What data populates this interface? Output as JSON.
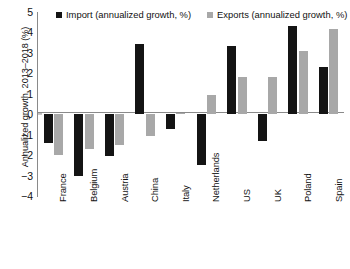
{
  "chart_data": {
    "type": "bar",
    "title": "",
    "xlabel": "",
    "ylabel": "Annualized growth, 2013–2018 (%)",
    "ylim": [
      -4,
      5
    ],
    "yticks": [
      5,
      4,
      3,
      2,
      1,
      0,
      -1,
      -2,
      -3,
      -4
    ],
    "ytick_labels": [
      "5",
      "4",
      "3",
      "2",
      "1",
      "0",
      "−1",
      "−2",
      "−3",
      "−4"
    ],
    "grid": false,
    "legend_position": "top",
    "categories": [
      "France",
      "Belgium",
      "Austria",
      "China",
      "Italy",
      "Netherlands",
      "US",
      "UK",
      "Poland",
      "Spain"
    ],
    "series": [
      {
        "name": "Import (annualized growth, %)",
        "color": "#141414",
        "values": [
          -1.4,
          -3.0,
          -2.05,
          3.45,
          -0.7,
          -2.5,
          3.35,
          -1.3,
          4.3,
          2.3
        ]
      },
      {
        "name": "Exports (annualized growth, %)",
        "color": "#a8a8a8",
        "values": [
          -2.0,
          -1.7,
          -1.5,
          -1.05,
          0.05,
          0.95,
          1.8,
          1.8,
          3.1,
          4.15
        ]
      }
    ]
  },
  "legend": {
    "items": [
      {
        "label": "Import (annualized growth, %)"
      },
      {
        "label": "Exports (annualized growth, %)"
      }
    ]
  }
}
